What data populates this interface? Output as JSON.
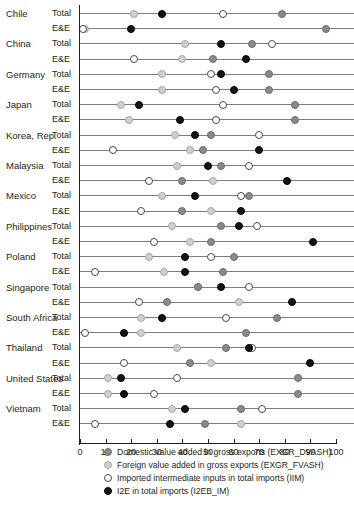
{
  "chart_data": {
    "type": "scatter",
    "title": "",
    "subtitle": "",
    "xlabel": "",
    "ylabel": "",
    "xlim": [
      0,
      100
    ],
    "xticks": [
      "0",
      "10",
      "20",
      "30",
      "40",
      "50",
      "60",
      "70",
      "80",
      "90",
      "100"
    ],
    "grid": false,
    "legend_position": "bottom",
    "row_types": [
      "Total",
      "E&E"
    ],
    "series": [
      {
        "key": "dvash",
        "name": "Domestic value added in gross exports (EXGR_DVASH)",
        "color": "#8a8a8a",
        "marker": "filled-gray-circle"
      },
      {
        "key": "fvash",
        "name": "Foreign value added in gross exports (EXGR_FVASH)",
        "color": "#cfcfcf",
        "marker": "light-gray-circle"
      },
      {
        "key": "iim",
        "name": "Imported intermediate inputs in total imports (IIM)",
        "color": "#ffffff",
        "marker": "open-circle"
      },
      {
        "key": "i2eb",
        "name": "I2E in total imports (I2EB_IM)",
        "color": "#141414",
        "marker": "filled-black-circle"
      }
    ],
    "countries": [
      {
        "name": "Chile",
        "Total": {
          "dvash": 79,
          "fvash": 21,
          "iim": 56,
          "i2eb": 32
        },
        "E&E": {
          "dvash": 96,
          "fvash": 2,
          "iim": 1,
          "i2eb": 20
        }
      },
      {
        "name": "China",
        "Total": {
          "dvash": 67,
          "fvash": 41,
          "iim": 75,
          "i2eb": 55
        },
        "E&E": {
          "dvash": 52,
          "fvash": 40,
          "iim": 21,
          "i2eb": 65
        }
      },
      {
        "name": "Germany",
        "Total": {
          "dvash": 74,
          "fvash": 32,
          "iim": 51,
          "i2eb": 55
        },
        "E&E": {
          "dvash": 74,
          "fvash": 32,
          "iim": 53,
          "i2eb": 60
        }
      },
      {
        "name": "Japan",
        "Total": {
          "dvash": 84,
          "fvash": 16,
          "iim": 56,
          "i2eb": 23
        },
        "E&E": {
          "dvash": 84,
          "fvash": 19,
          "iim": 53,
          "i2eb": 39
        }
      },
      {
        "name": "Korea, Rep.",
        "Total": {
          "dvash": 51,
          "fvash": 37,
          "iim": 70,
          "i2eb": 45
        },
        "E&E": {
          "dvash": 48,
          "fvash": 43,
          "iim": 13,
          "i2eb": 70
        }
      },
      {
        "name": "Malaysia",
        "Total": {
          "dvash": 55,
          "fvash": 38,
          "iim": 66,
          "i2eb": 50
        },
        "E&E": {
          "dvash": 40,
          "fvash": 52,
          "iim": 27,
          "i2eb": 81
        }
      },
      {
        "name": "Mexico",
        "Total": {
          "dvash": 66,
          "fvash": 32,
          "iim": 63,
          "i2eb": 45
        },
        "E&E": {
          "dvash": 40,
          "fvash": 51,
          "iim": 24,
          "i2eb": 63
        }
      },
      {
        "name": "Philippines",
        "Total": {
          "dvash": 55,
          "fvash": 36,
          "iim": 69,
          "i2eb": 62
        },
        "E&E": {
          "dvash": 51,
          "fvash": 43,
          "iim": 29,
          "i2eb": 91
        }
      },
      {
        "name": "Poland",
        "Total": {
          "dvash": 60,
          "fvash": 27,
          "iim": 51,
          "i2eb": 41
        },
        "E&E": {
          "dvash": 56,
          "fvash": 33,
          "iim": 6,
          "i2eb": 41
        }
      },
      {
        "name": "Singapore",
        "Total": {
          "dvash": 46,
          "fvash": 46,
          "iim": 66,
          "i2eb": 55
        },
        "E&E": {
          "dvash": 34,
          "fvash": 62,
          "iim": 23,
          "i2eb": 83
        }
      },
      {
        "name": "South Africa",
        "Total": {
          "dvash": 77,
          "fvash": 24,
          "iim": 57,
          "i2eb": 32
        },
        "E&E": {
          "dvash": 65,
          "fvash": 24,
          "iim": 2,
          "i2eb": 17
        }
      },
      {
        "name": "Thailand",
        "Total": {
          "dvash": 57,
          "fvash": 38,
          "iim": 67,
          "i2eb": 66
        },
        "E&E": {
          "dvash": 43,
          "fvash": 51,
          "iim": 17,
          "i2eb": 90
        }
      },
      {
        "name": "United States",
        "Total": {
          "dvash": 85,
          "fvash": 11,
          "iim": 38,
          "i2eb": 16
        },
        "E&E": {
          "dvash": 85,
          "fvash": 11,
          "iim": 29,
          "i2eb": 17
        }
      },
      {
        "name": "Vietnam",
        "Total": {
          "dvash": 63,
          "fvash": 36,
          "iim": 71,
          "i2eb": 41
        },
        "E&E": {
          "dvash": 49,
          "fvash": 63,
          "iim": 6,
          "i2eb": 35
        }
      }
    ]
  }
}
